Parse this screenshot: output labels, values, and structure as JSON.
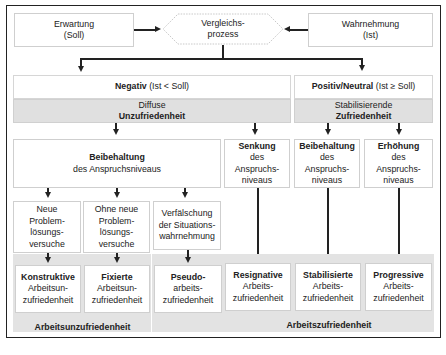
{
  "diagram": {
    "top": {
      "expectation": {
        "line1": "Erwartung",
        "line2": "(Soll)"
      },
      "comparison": {
        "line1": "Vergleichs-",
        "line2": "prozess"
      },
      "perception": {
        "line1": "Wahrnehmung",
        "line2": "(Ist)"
      }
    },
    "negative": {
      "title_bold": "Negativ",
      "title_rest": " (Ist < Soll)",
      "sub_line1": "Diffuse",
      "sub_line2": "Unzufriedenheit"
    },
    "positive": {
      "title_bold": "Positiv/Neutral",
      "title_rest": " (Ist ≥ Soll)",
      "sub_line1": "Stabilisierende",
      "sub_line2": "Zufriedenheit"
    },
    "level_boxes": {
      "keep_neg": {
        "bold": "Beibehaltung",
        "rest": "des Anspruchsniveaus"
      },
      "lower": {
        "bold": "Senkung",
        "l2": "des",
        "l3": "Anspruchs-",
        "l4": "niveaus"
      },
      "keep_pos": {
        "bold": "Beibehaltung",
        "l2": "des",
        "l3": "Anspruchs-",
        "l4": "niveaus"
      },
      "raise": {
        "bold": "Erhöhung",
        "l2": "des",
        "l3": "Anspruchs-",
        "l4": "niveaus"
      }
    },
    "strategies": [
      {
        "l1": "Neue",
        "l2": "Problem-",
        "l3": "lösungs-",
        "l4": "versuche"
      },
      {
        "l1": "Ohne neue",
        "l2": "Problem-",
        "l3": "lösungs-",
        "l4": "versuche"
      },
      {
        "l1": "Verfälschung",
        "l2": "der Situations-",
        "l3": "wahrnehmung"
      }
    ],
    "outcomes": [
      {
        "bold": "Konstruktive",
        "l2": "Arbeitsun-",
        "l3": "zufriedenheit"
      },
      {
        "bold": "Fixierte",
        "l2": "Arbeitsun-",
        "l3": "zufriedenheit"
      },
      {
        "bold": "Pseudo-",
        "l2": "arbeits-",
        "l3": "zufriedenheit"
      },
      {
        "bold": "Resignative",
        "l2": "Arbeits-",
        "l3": "zufriedenheit"
      },
      {
        "bold": "Stabilisierte",
        "l2": "Arbeits-",
        "l3": "zufriedenheit"
      },
      {
        "bold": "Progressive",
        "l2": "Arbeits-",
        "l3": "zufriedenheit"
      }
    ],
    "group_labels": {
      "dissatisfaction": "Arbeitsunzufriedenheit",
      "satisfaction": "Arbeitszufriedenheit"
    },
    "colors": {
      "grey_band": "#e3e3e3",
      "border": "#cfcfcf",
      "lines": "#222222"
    }
  }
}
